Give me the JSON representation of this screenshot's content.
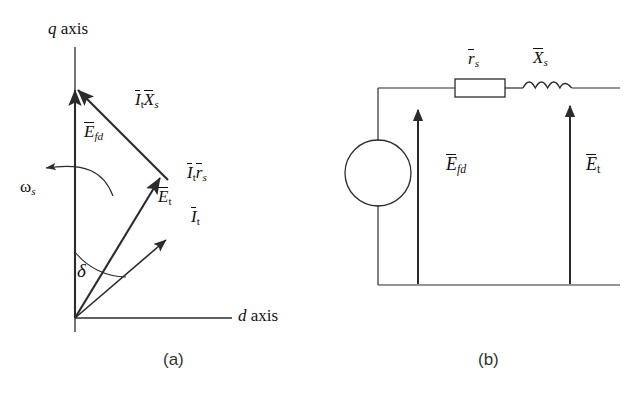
{
  "figure": {
    "captions": {
      "a": "(a)",
      "b": "(b)"
    }
  },
  "phasor_diagram": {
    "name": "phasor-diagram",
    "axes": {
      "q": {
        "symbol": "q",
        "text": "axis",
        "full": "q axis"
      },
      "d": {
        "symbol": "d",
        "text": "axis",
        "full": "d axis"
      }
    },
    "angle_label": {
      "symbol": "δ",
      "name": "delta"
    },
    "rotation_label": {
      "symbol": "ω",
      "sub": "s",
      "full": "ωs"
    },
    "vectors": [
      {
        "name": "E-fd",
        "base": "E",
        "sub": "fd",
        "overbar": true,
        "label": "Ēfd"
      },
      {
        "name": "It-Xs",
        "base": "I",
        "sub": "t",
        "base2": "X",
        "sub2": "s",
        "overbar": true,
        "label": "ĪtX̄s"
      },
      {
        "name": "It-rs",
        "base": "I",
        "sub": "t",
        "base2": "r",
        "sub2": "s",
        "overbar": true,
        "label": "Ītr̄s"
      },
      {
        "name": "E-t",
        "base": "E",
        "sub": "t",
        "overbar": true,
        "label": "Ēt"
      },
      {
        "name": "I-t",
        "base": "I",
        "sub": "t",
        "overbar": true,
        "label": "Īt"
      }
    ]
  },
  "circuit_diagram": {
    "name": "equivalent-circuit",
    "components": [
      {
        "name": "voltage-source",
        "type": "circle-source",
        "label": ""
      },
      {
        "name": "resistor",
        "type": "box",
        "base": "r",
        "sub": "s",
        "overbar": true,
        "label": "r̄s"
      },
      {
        "name": "inductor",
        "type": "coil",
        "base": "X",
        "sub": "s",
        "overbar": true,
        "label": "X̄s"
      }
    ],
    "voltage_arrows": [
      {
        "name": "E-fd-arrow",
        "base": "E",
        "sub": "fd",
        "overbar": true,
        "label": "Ēfd"
      },
      {
        "name": "E-t-arrow",
        "base": "E",
        "sub": "t",
        "overbar": true,
        "label": "Ēt"
      }
    ]
  },
  "style": {
    "line_color": "#2b2b2b",
    "text_color": "#111111",
    "background": "#ffffff"
  }
}
